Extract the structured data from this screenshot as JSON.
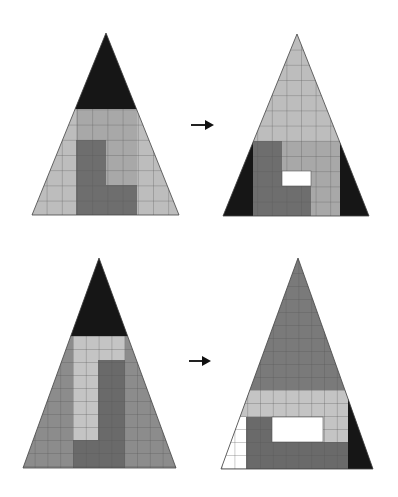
{
  "diagram": {
    "colors": {
      "black": "#161616",
      "dark_gray": "#6e6e6e",
      "mid_gray": "#8c8c8c",
      "light_gray": "#bdbdbd",
      "white": "#ffffff",
      "grid_line": "#555555"
    },
    "rows": [
      {
        "label": "top-puzzle",
        "before": {
          "name": "triangle-top-left"
        },
        "arrow": "right-arrow",
        "after": {
          "name": "triangle-top-right",
          "hole": "white-gap"
        }
      },
      {
        "label": "bottom-puzzle",
        "before": {
          "name": "triangle-bottom-left"
        },
        "arrow": "right-arrow",
        "after": {
          "name": "triangle-bottom-right",
          "hole": "white-gap"
        }
      }
    ]
  }
}
